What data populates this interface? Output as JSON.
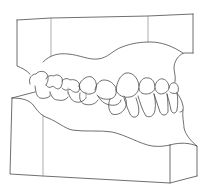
{
  "figure": {
    "subject": "Line drawing of a dental cast model showing upper and lower teeth in occlusion",
    "stroke_color": "#4a4a4a",
    "background_color": "#ffffff"
  }
}
